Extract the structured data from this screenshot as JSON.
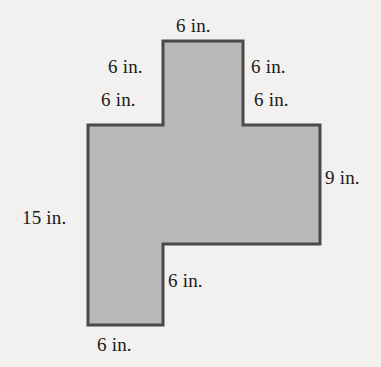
{
  "figure": {
    "units": "in.",
    "fill_color": "#b9b9b9",
    "stroke_color": "#4a4a4a",
    "background_color": "#f2f1ef",
    "stroke_width": 3,
    "polygon_points": "163,41 243,41 243,125 320,125 320,244 163,244 163,325 88,325 88,125 163,125",
    "vertices": [
      {
        "name": "tab-top-left",
        "x": 163,
        "y": 41
      },
      {
        "name": "tab-top-right",
        "x": 243,
        "y": 41
      },
      {
        "name": "tab-bottom-right",
        "x": 243,
        "y": 125
      },
      {
        "name": "body-top-right",
        "x": 320,
        "y": 125
      },
      {
        "name": "body-bottom-right",
        "x": 320,
        "y": 244
      },
      {
        "name": "step-inner-corner",
        "x": 163,
        "y": 244
      },
      {
        "name": "foot-bottom-right",
        "x": 163,
        "y": 325
      },
      {
        "name": "foot-bottom-left",
        "x": 88,
        "y": 325
      },
      {
        "name": "body-bottom-left",
        "x": 88,
        "y": 125
      },
      {
        "name": "tab-shoulder-left",
        "x": 163,
        "y": 125
      }
    ],
    "labels": {
      "top_tab": "6 in.",
      "tab_left_side": "6 in.",
      "tab_right_side": "6 in.",
      "shoulder_left": "6 in.",
      "shoulder_right": "6 in.",
      "right_side": "9 in.",
      "left_side": "15 in.",
      "inner_bottom": "6 in.",
      "bottom": "6 in."
    }
  }
}
